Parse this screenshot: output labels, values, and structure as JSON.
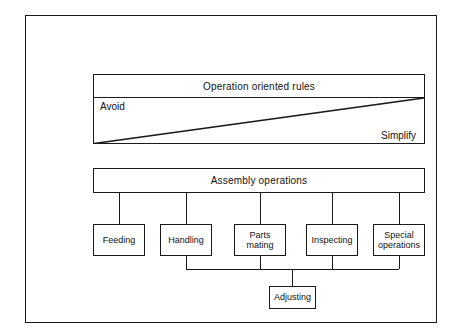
{
  "diagram": {
    "rules_panel": {
      "header": "Operation oriented rules",
      "left_label": "Avoid",
      "right_label": "Simplify"
    },
    "assembly": {
      "header": "Assembly operations",
      "operations": [
        {
          "id": "feeding",
          "label": "Feeding",
          "feeds_adjusting": false
        },
        {
          "id": "handling",
          "label": "Handling",
          "feeds_adjusting": true
        },
        {
          "id": "parts",
          "label": "Parts\nmating",
          "feeds_adjusting": true
        },
        {
          "id": "inspecting",
          "label": "Inspecting",
          "feeds_adjusting": true
        },
        {
          "id": "special",
          "label": "Special\noperations",
          "feeds_adjusting": true
        }
      ],
      "adjusting": {
        "label": "Adjusting"
      }
    },
    "colors": {
      "line": "#1a1a1a",
      "background": "#ffffff",
      "text": "#111111"
    }
  }
}
